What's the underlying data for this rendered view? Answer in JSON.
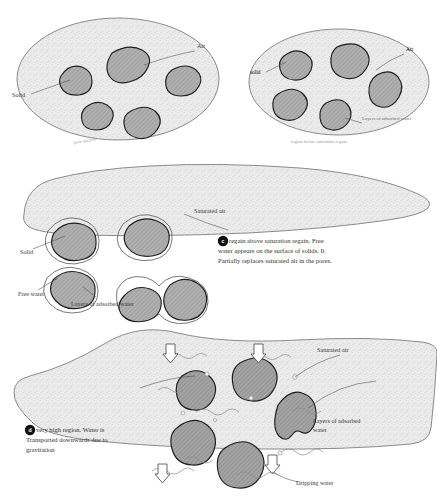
{
  "figure": {
    "background_color": "#ffffff",
    "fill_color": "#e8e8e8",
    "blob_fill_color": "#a9a9a9",
    "outline_color": "#777777",
    "blob_outline_color": "#1d1d1d",
    "text_color": "#3a3a3a"
  },
  "panels": [
    {
      "id": "panel-a",
      "shape": "ellipse",
      "caption": "pore section",
      "labels": [
        {
          "name": "solid-label",
          "text": "Solid"
        },
        {
          "name": "air-label",
          "text": "Air"
        }
      ]
    },
    {
      "id": "panel-b",
      "shape": "ellipse",
      "caption": "region below saturation regain",
      "labels": [
        {
          "name": "solid-label",
          "text": "solid"
        },
        {
          "name": "air-label",
          "text": "Air"
        },
        {
          "name": "adsorbed-water-label",
          "text": "Layers of adsorbed water"
        }
      ]
    },
    {
      "id": "panel-c",
      "shape": "irregular-wedge",
      "bullet": "c",
      "note_lines": [
        "regain above        saturation regain. Free",
        "water appears on the surface of solids. It",
        "Partially replaces saturated air in the pores."
      ],
      "labels": [
        {
          "name": "solid-label",
          "text": "Solid"
        },
        {
          "name": "free-water-label",
          "text": "Free water"
        },
        {
          "name": "adsorbed-water-label",
          "text": "Layers of adsorbed water"
        },
        {
          "name": "saturated-air-label",
          "text": "Saturated air"
        }
      ]
    },
    {
      "id": "panel-d",
      "shape": "irregular-flask",
      "bullet": "d",
      "note_lines": [
        "very high region.   Water is",
        "Transported downwards due to",
        "gravitation"
      ],
      "labels": [
        {
          "name": "saturated-air-label",
          "text": "Saturated air"
        },
        {
          "name": "adsorbed-water-label-line1",
          "text": "Layers of adsorbed"
        },
        {
          "name": "adsorbed-water-label-line2",
          "text": "water"
        },
        {
          "name": "dripping-water-label",
          "text": "Dripping water"
        }
      ],
      "flow_arrows": 4,
      "arrow_direction": "down"
    }
  ]
}
